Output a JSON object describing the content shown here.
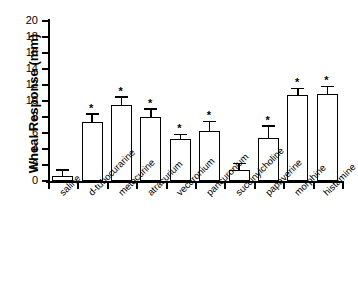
{
  "chart_data": {
    "type": "bar",
    "title": "",
    "xlabel": "",
    "ylabel": "Wheal Response (mm)",
    "ylim": [
      0,
      20
    ],
    "yticks": [
      0,
      2,
      4,
      6,
      8,
      10,
      12,
      14,
      16,
      18,
      20
    ],
    "grid": false,
    "legend": null,
    "error_type": "SEM",
    "significance_marker": "*",
    "significance_note": "* denotes significant difference versus saline",
    "categories": [
      "saline",
      "d-tubocurarine",
      "metocurine",
      "atracurium",
      "vecuronium",
      "pancuronium",
      "succinylcholine",
      "papaverine",
      "morphine",
      "histamine"
    ],
    "values": [
      0.65,
      7.4,
      9.45,
      7.95,
      5.2,
      6.3,
      1.4,
      5.4,
      10.7,
      10.9
    ],
    "errors": [
      0.65,
      0.85,
      0.95,
      0.95,
      0.5,
      1.05,
      0.7,
      1.35,
      0.75,
      0.8
    ],
    "significant": [
      false,
      true,
      true,
      true,
      true,
      true,
      false,
      true,
      true,
      true
    ],
    "bars": [
      {
        "label": "saline",
        "value": 0.65,
        "error": 0.65,
        "star": false
      },
      {
        "label": "d-tubocurarine",
        "value": 7.4,
        "error": 0.85,
        "star": true
      },
      {
        "label": "metocurine",
        "value": 9.45,
        "error": 0.95,
        "star": true
      },
      {
        "label": "atracurium",
        "value": 7.95,
        "error": 0.95,
        "star": true
      },
      {
        "label": "vecuronium",
        "value": 5.2,
        "error": 0.5,
        "star": true
      },
      {
        "label": "pancuronium",
        "value": 6.3,
        "error": 1.05,
        "star": true
      },
      {
        "label": "succinylcholine",
        "value": 1.4,
        "error": 0.7,
        "star": false
      },
      {
        "label": "papaverine",
        "value": 5.4,
        "error": 1.35,
        "star": true
      },
      {
        "label": "morphine",
        "value": 10.7,
        "error": 0.75,
        "star": true
      },
      {
        "label": "histamine",
        "value": 10.9,
        "error": 0.8,
        "star": true
      }
    ],
    "colors": {
      "bar_fill": "#ffffff",
      "bar_edge": "#000000",
      "axis": "#000000",
      "text": "#000000",
      "background": "#ffffff"
    }
  }
}
